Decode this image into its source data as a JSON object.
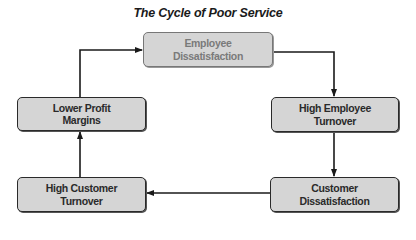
{
  "diagram": {
    "title": "The Cycle of Poor Service",
    "type": "cycle-flowchart",
    "nodes": [
      {
        "id": "employee-dissatisfaction",
        "label": "Employee\nDissatisfaction",
        "line1": "Employee",
        "line2": "Dissatisfaction",
        "position": "top-center"
      },
      {
        "id": "high-employee-turnover",
        "label": "High Employee\nTurnover",
        "line1": "High Employee",
        "line2": "Turnover",
        "position": "middle-right"
      },
      {
        "id": "customer-dissatisfaction",
        "label": "Customer\nDissatisfaction",
        "line1": "Customer",
        "line2": "Dissatisfaction",
        "position": "bottom-right"
      },
      {
        "id": "high-customer-turnover",
        "label": "High Customer\nTurnover",
        "line1": "High Customer",
        "line2": "Turnover",
        "position": "bottom-left"
      },
      {
        "id": "lower-profit-margins",
        "label": "Lower Profit\nMargins",
        "line1": "Lower Profit",
        "line2": "Margins",
        "position": "middle-left"
      }
    ],
    "edges": [
      {
        "from": "employee-dissatisfaction",
        "to": "high-employee-turnover"
      },
      {
        "from": "high-employee-turnover",
        "to": "customer-dissatisfaction"
      },
      {
        "from": "customer-dissatisfaction",
        "to": "high-customer-turnover"
      },
      {
        "from": "high-customer-turnover",
        "to": "lower-profit-margins"
      },
      {
        "from": "lower-profit-margins",
        "to": "employee-dissatisfaction"
      }
    ],
    "colors": {
      "box_fill": "#d5d5d5",
      "box_border": "#2a2a2a",
      "text": "#2a2a2a",
      "faded_text": "#7a7a7a",
      "arrow": "#1a1a1a"
    }
  }
}
